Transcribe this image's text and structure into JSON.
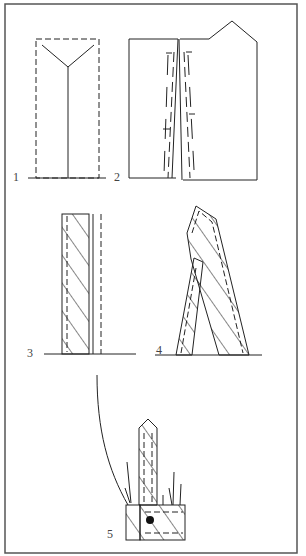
{
  "figure": {
    "panels": [
      {
        "id": 1,
        "label": "1",
        "description": "Dashed rectangle outline with Y-shaped center line"
      },
      {
        "id": 2,
        "label": "2",
        "description": "Pentagon-topped panel with slanted dashed lines and T-marks"
      },
      {
        "id": 3,
        "label": "3",
        "description": "Hatched vertical strip beside a dashed double line"
      },
      {
        "id": 4,
        "label": "4",
        "description": "Two hatched strips leaning to form an A shape with pointed top"
      },
      {
        "id": 5,
        "label": "5",
        "description": "Pointed hatched strip on hatched base with dot, grass strokes and curved line"
      }
    ]
  },
  "colors": {
    "stroke": "#222222",
    "frame": "#555555",
    "background": "#ffffff"
  }
}
